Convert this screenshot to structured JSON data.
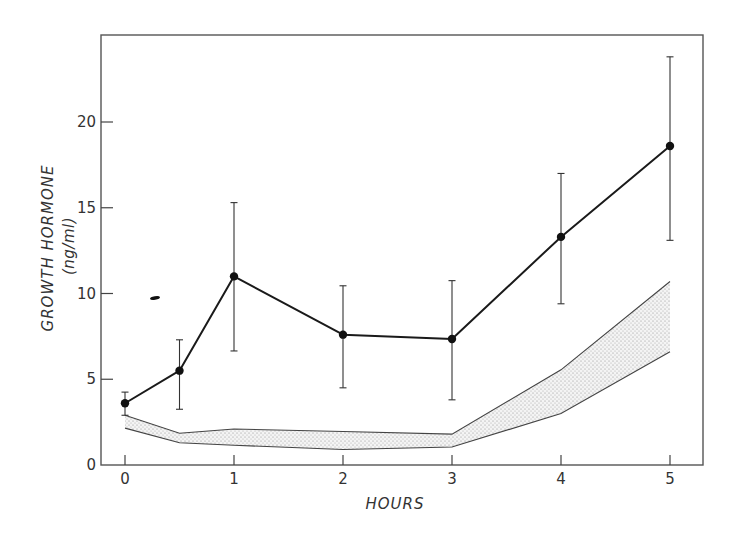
{
  "chart_data": {
    "type": "line",
    "title": "",
    "xlabel": "HOURS",
    "ylabel": "GROWTH HORMONE",
    "ylabel_units": "(ng/ml)",
    "xlim": [
      -0.2,
      5.3
    ],
    "ylim": [
      0,
      24.5
    ],
    "x_ticks": [
      0,
      1,
      2,
      3,
      4,
      5
    ],
    "x_tick_labels": [
      "0",
      "1",
      "2",
      "3",
      "4",
      "5"
    ],
    "y_ticks": [
      0,
      5,
      10,
      15,
      20
    ],
    "y_tick_labels": [
      "0",
      "5",
      "10",
      "15",
      "20"
    ],
    "grid": false,
    "legend": null,
    "x": [
      0,
      0.5,
      1,
      2,
      3,
      4,
      5
    ],
    "series": [
      {
        "name": "mean growth hormone",
        "style": "line-with-filled-circles",
        "values": [
          3.6,
          5.5,
          11.0,
          7.6,
          7.35,
          13.3,
          18.6
        ],
        "error_upper": [
          4.25,
          7.3,
          15.3,
          10.45,
          10.75,
          17.0,
          23.8
        ],
        "error_lower": [
          2.9,
          3.25,
          6.65,
          4.5,
          3.8,
          9.4,
          13.1
        ]
      }
    ],
    "band": {
      "name": "reference range (stippled)",
      "x": [
        0,
        0.5,
        1,
        2,
        3,
        4,
        5
      ],
      "upper": [
        2.9,
        1.85,
        2.1,
        1.95,
        1.8,
        5.55,
        10.7
      ],
      "lower": [
        2.15,
        1.3,
        1.15,
        0.9,
        1.05,
        3.0,
        6.6
      ]
    }
  },
  "labels": {
    "x_axis_title": "HOURS",
    "y_axis_title": "GROWTH HORMONE",
    "y_axis_units": "(ng/ml)"
  },
  "colors": {
    "line": "#1a1a1a",
    "frame": "#555555",
    "band_stipple": "#9a9a9a",
    "background": "#ffffff"
  }
}
